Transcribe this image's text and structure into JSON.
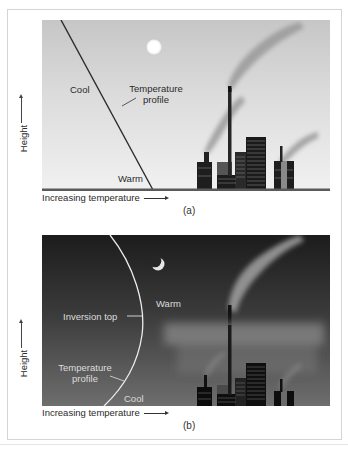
{
  "figure": {
    "panels": [
      {
        "id": "a",
        "caption": "(a)",
        "scene": "daytime",
        "celestial_body": "sun-icon",
        "labels": {
          "cool": "Cool",
          "warm": "Warm",
          "temperature_profile_line1": "Temperature",
          "temperature_profile_line2": "profile"
        },
        "y_axis_label": "Height",
        "x_axis_label": "Increasing temperature",
        "profile": "straight line: cool at top, warm at ground (temperature decreases with height)",
        "colors": {
          "sky_top": "#c6c6c6",
          "sky_bottom": "#f1f1f1",
          "line": "#2b2b2b"
        }
      },
      {
        "id": "b",
        "caption": "(b)",
        "scene": "nighttime",
        "celestial_body": "crescent-moon-icon",
        "labels": {
          "warm": "Warm",
          "inversion_top": "Inversion top",
          "temperature_profile_line1": "Temperature",
          "temperature_profile_line2": "profile",
          "cool": "Cool"
        },
        "y_axis_label": "Height",
        "x_axis_label": "Increasing temperature",
        "profile": "curved line: cool at ground, warmer aloft up to inversion top, trapping smoke beneath",
        "colors": {
          "sky_top": "#1c1c1c",
          "sky_bottom": "#6e6e6e",
          "line": "#e8e8e8"
        }
      }
    ]
  }
}
